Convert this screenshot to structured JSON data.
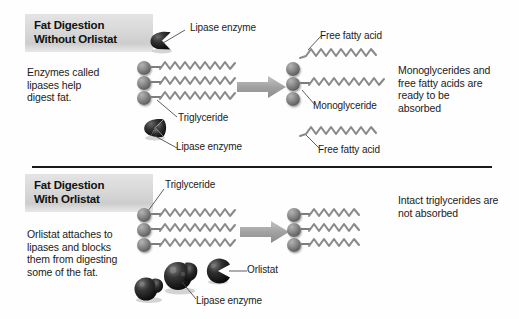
{
  "figure": {
    "title_top": "Fat Digestion\nWithout Orlistat",
    "title_bottom": "Fat Digestion\nWith Orlistat",
    "accent_gray": "#d2d2d2",
    "molecule_gray": "#7d7d7d",
    "enzyme_dark": "#1c1c1c",
    "arrow_gray": "#9a9a9a",
    "divider_color": "#1a1a1a"
  },
  "top_panel": {
    "heading": "Fat Digestion\nWithout Orlistat",
    "description": "Enzymes called\nlipases help\ndigest fat.",
    "result_text": "Monoglycerides and\nfree fatty acids are\nready to be\nabsorbed",
    "labels": {
      "lipase_upper": "Lipase enzyme",
      "lipase_lower": "Lipase enzyme",
      "triglyceride": "Triglyceride",
      "free_fatty_acid_upper": "Free fatty acid",
      "monoglyceride": "Monoglyceride",
      "free_fatty_acid_lower": "Free fatty acid"
    }
  },
  "bottom_panel": {
    "heading": "Fat Digestion\nWith Orlistat",
    "description": "Orlistat attaches to\nlipases and blocks\nthem from digesting\nsome of the fat.",
    "result_text": "Intact triglycerides are\nnot absorbed",
    "labels": {
      "triglyceride": "Triglyceride",
      "orlistat": "Orlistat",
      "lipase_enzyme": "Lipase enzyme"
    }
  }
}
